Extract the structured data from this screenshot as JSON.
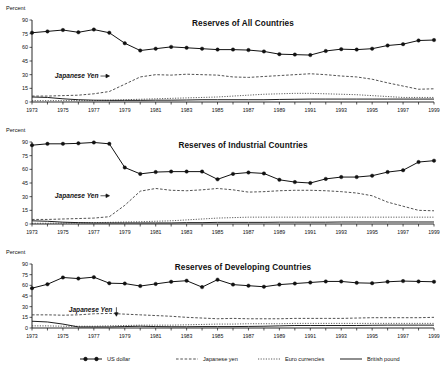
{
  "figure": {
    "axis_label": "Percent",
    "y_ticks": [
      0,
      15,
      30,
      45,
      60,
      75,
      90
    ],
    "y_limits": [
      0,
      90
    ],
    "x_ticks": [
      1973,
      1975,
      1977,
      1979,
      1981,
      1983,
      1985,
      1987,
      1989,
      1991,
      1993,
      1995,
      1997,
      1999
    ],
    "x_limits": [
      1973,
      1999
    ],
    "annotation_label": "Japanese Yen"
  },
  "legend": {
    "items": [
      {
        "label": "US dollar",
        "style": "solid-marker"
      },
      {
        "label": "Japanese yen",
        "style": "dashed"
      },
      {
        "label": "Euro currencies",
        "style": "dotted"
      },
      {
        "label": "British pound",
        "style": "solid"
      }
    ]
  },
  "chart_data": [
    {
      "type": "line",
      "title": "Reserves of All Countries",
      "xlabel": "",
      "ylabel": "Percent",
      "xlim": [
        1973,
        1999
      ],
      "ylim": [
        0,
        90
      ],
      "grid": false,
      "legend_position": "bottom",
      "annotations": [
        {
          "text": "Japanese Yen",
          "x": 1977.3,
          "y": 28.5,
          "arrow": "right"
        }
      ],
      "x": [
        1973,
        1974,
        1975,
        1976,
        1977,
        1978,
        1979,
        1980,
        1981,
        1982,
        1983,
        1984,
        1985,
        1986,
        1987,
        1988,
        1989,
        1990,
        1991,
        1992,
        1993,
        1994,
        1995,
        1996,
        1997,
        1998,
        1999
      ],
      "series": [
        {
          "name": "US dollar",
          "values": [
            76.0,
            77.5,
            79.0,
            76.5,
            79.5,
            76.0,
            64.5,
            56.5,
            58.5,
            60.5,
            59.5,
            58.5,
            57.5,
            57.5,
            57.0,
            55.5,
            52.5,
            52.0,
            51.5,
            56.0,
            58.0,
            57.5,
            58.5,
            62.0,
            63.5,
            67.5,
            68.0
          ]
        },
        {
          "name": "Japanese yen",
          "values": [
            6.5,
            6.5,
            7.0,
            7.5,
            9.0,
            11.5,
            19.5,
            27.5,
            30.0,
            29.5,
            30.5,
            30.0,
            29.5,
            27.5,
            27.0,
            28.0,
            29.0,
            30.0,
            31.0,
            30.0,
            28.5,
            27.5,
            25.0,
            21.0,
            17.5,
            14.0,
            14.5
          ]
        },
        {
          "name": "Euro currencies",
          "values": [
            1.5,
            1.5,
            1.5,
            1.5,
            1.5,
            2.0,
            2.5,
            3.0,
            3.5,
            4.0,
            4.5,
            5.0,
            5.5,
            6.5,
            7.5,
            8.5,
            9.0,
            9.5,
            9.5,
            9.0,
            8.5,
            8.0,
            7.0,
            6.0,
            5.0,
            5.0,
            5.0
          ]
        },
        {
          "name": "British pound",
          "values": [
            5.5,
            5.0,
            3.5,
            2.5,
            2.0,
            1.8,
            1.8,
            1.8,
            2.0,
            2.0,
            2.2,
            2.5,
            2.5,
            2.5,
            2.5,
            2.5,
            2.8,
            3.0,
            3.2,
            3.2,
            3.2,
            3.2,
            3.2,
            3.2,
            3.2,
            3.2,
            3.2
          ]
        }
      ]
    },
    {
      "type": "line",
      "title": "Reserves of Industrial Countries",
      "xlabel": "",
      "ylabel": "Percent",
      "xlim": [
        1973,
        1999
      ],
      "ylim": [
        0,
        90
      ],
      "grid": false,
      "legend_position": "bottom",
      "annotations": [
        {
          "text": "Japanese Yen",
          "x": 1977.3,
          "y": 31.0,
          "arrow": "right"
        }
      ],
      "x": [
        1973,
        1974,
        1975,
        1976,
        1977,
        1978,
        1979,
        1980,
        1981,
        1982,
        1983,
        1984,
        1985,
        1986,
        1987,
        1988,
        1989,
        1990,
        1991,
        1992,
        1993,
        1994,
        1995,
        1996,
        1997,
        1998,
        1999
      ],
      "series": [
        {
          "name": "US dollar",
          "values": [
            86.5,
            88.0,
            88.0,
            88.5,
            89.5,
            88.0,
            62.0,
            55.0,
            57.0,
            57.5,
            57.5,
            57.5,
            49.0,
            55.0,
            56.5,
            55.5,
            48.5,
            46.0,
            45.0,
            49.5,
            51.5,
            51.5,
            53.0,
            57.0,
            59.0,
            68.0,
            69.5
          ]
        },
        {
          "name": "Japanese yen",
          "values": [
            5.0,
            5.0,
            5.5,
            6.0,
            6.5,
            8.0,
            20.5,
            36.0,
            39.0,
            37.0,
            36.5,
            37.5,
            39.0,
            37.5,
            35.0,
            35.5,
            36.5,
            37.0,
            37.0,
            36.5,
            35.5,
            34.0,
            31.0,
            24.0,
            19.5,
            15.0,
            14.5
          ]
        },
        {
          "name": "Euro currencies",
          "values": [
            0.8,
            0.8,
            1.0,
            1.2,
            1.5,
            1.8,
            2.2,
            2.5,
            3.0,
            3.5,
            4.5,
            5.5,
            6.5,
            7.0,
            7.5,
            7.5,
            7.5,
            7.5,
            7.5,
            7.5,
            7.5,
            7.5,
            7.5,
            7.5,
            7.5,
            7.5,
            7.5
          ]
        },
        {
          "name": "British pound",
          "values": [
            3.5,
            3.0,
            2.0,
            1.5,
            1.2,
            1.2,
            1.2,
            1.2,
            1.2,
            1.2,
            1.5,
            1.5,
            1.8,
            1.8,
            1.8,
            1.8,
            2.0,
            2.0,
            2.0,
            2.0,
            2.2,
            2.2,
            2.2,
            2.2,
            2.2,
            2.2,
            2.2
          ]
        }
      ]
    },
    {
      "type": "line",
      "title": "Reserves of Developing Countries",
      "xlabel": "",
      "ylabel": "Percent",
      "xlim": [
        1973,
        1999
      ],
      "ylim": [
        0,
        90
      ],
      "grid": false,
      "legend_position": "bottom",
      "annotations": [
        {
          "text": "Japanese Yen",
          "x": 1978.2,
          "y": 25.0,
          "arrow": "down"
        }
      ],
      "x": [
        1973,
        1974,
        1975,
        1976,
        1977,
        1978,
        1979,
        1980,
        1981,
        1982,
        1983,
        1984,
        1985,
        1986,
        1987,
        1988,
        1989,
        1990,
        1991,
        1992,
        1993,
        1994,
        1995,
        1996,
        1997,
        1998,
        1999
      ],
      "series": [
        {
          "name": "US dollar",
          "values": [
            56.0,
            61.5,
            71.0,
            69.5,
            71.5,
            63.0,
            62.5,
            59.0,
            62.0,
            65.0,
            66.5,
            57.5,
            68.0,
            61.0,
            59.5,
            58.0,
            61.0,
            62.5,
            64.0,
            65.5,
            65.5,
            63.5,
            63.0,
            65.0,
            66.0,
            65.5,
            65.0
          ]
        },
        {
          "name": "Japanese yen",
          "values": [
            18.5,
            18.5,
            18.0,
            18.5,
            20.0,
            20.5,
            19.5,
            18.5,
            17.5,
            16.5,
            15.0,
            14.0,
            13.0,
            13.5,
            13.0,
            13.0,
            13.0,
            13.5,
            13.5,
            13.5,
            13.5,
            14.0,
            14.5,
            14.5,
            14.5,
            14.5,
            15.0
          ]
        },
        {
          "name": "Euro currencies",
          "values": [
            3.0,
            3.0,
            2.5,
            2.5,
            2.5,
            3.0,
            3.5,
            4.0,
            4.0,
            4.0,
            4.5,
            5.0,
            5.5,
            5.5,
            6.0,
            6.0,
            6.0,
            6.5,
            6.5,
            6.5,
            6.5,
            6.5,
            6.5,
            6.5,
            6.5,
            6.5,
            6.5
          ]
        },
        {
          "name": "British pound",
          "values": [
            9.5,
            8.5,
            5.5,
            1.5,
            1.5,
            1.5,
            2.0,
            2.5,
            2.0,
            1.8,
            1.8,
            2.0,
            2.0,
            2.0,
            2.2,
            2.5,
            3.0,
            3.5,
            3.5,
            3.5,
            3.5,
            3.5,
            3.8,
            4.0,
            4.0,
            4.0,
            4.0
          ]
        }
      ]
    }
  ]
}
